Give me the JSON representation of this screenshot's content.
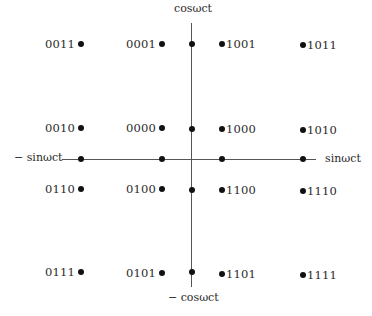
{
  "axes": {
    "top_label": "cosωct",
    "bottom_label": "− cosωct",
    "left_label": "− sinωct",
    "right_label": "sinωct",
    "horizontal": {
      "x1": 62,
      "x2": 316,
      "y": 159
    },
    "vertical": {
      "x": 191,
      "y1": 23,
      "y2": 287
    }
  },
  "axis_markers": [
    {
      "x": 81,
      "y": 159
    },
    {
      "x": 162,
      "y": 159
    },
    {
      "x": 222,
      "y": 159
    },
    {
      "x": 303,
      "y": 159
    },
    {
      "x": 192,
      "y": 44
    },
    {
      "x": 192,
      "y": 129
    },
    {
      "x": 192,
      "y": 190
    },
    {
      "x": 192,
      "y": 272
    }
  ],
  "points": [
    {
      "code": "0011",
      "x": 81,
      "y": 44,
      "side": "left"
    },
    {
      "code": "0001",
      "x": 162,
      "y": 44,
      "side": "left"
    },
    {
      "code": "1001",
      "x": 222,
      "y": 44,
      "side": "right"
    },
    {
      "code": "1011",
      "x": 303,
      "y": 45,
      "side": "right"
    },
    {
      "code": "0010",
      "x": 81,
      "y": 128,
      "side": "left"
    },
    {
      "code": "0000",
      "x": 162,
      "y": 128,
      "side": "left"
    },
    {
      "code": "1000",
      "x": 222,
      "y": 129,
      "side": "right"
    },
    {
      "code": "1010",
      "x": 303,
      "y": 130,
      "side": "right"
    },
    {
      "code": "0110",
      "x": 81,
      "y": 189,
      "side": "left"
    },
    {
      "code": "0100",
      "x": 162,
      "y": 189,
      "side": "left"
    },
    {
      "code": "1100",
      "x": 222,
      "y": 190,
      "side": "right"
    },
    {
      "code": "1110",
      "x": 303,
      "y": 191,
      "side": "right"
    },
    {
      "code": "0111",
      "x": 81,
      "y": 272,
      "side": "left"
    },
    {
      "code": "0101",
      "x": 162,
      "y": 273,
      "side": "left"
    },
    {
      "code": "1101",
      "x": 222,
      "y": 274,
      "side": "right"
    },
    {
      "code": "1111",
      "x": 303,
      "y": 275,
      "side": "right"
    }
  ]
}
